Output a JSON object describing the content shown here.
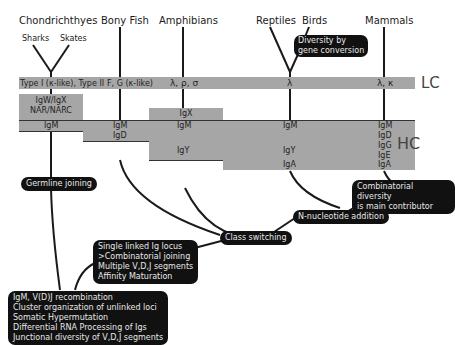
{
  "taxa": {
    "chondrichthyes": "Chondrichthyes",
    "sharks": "Sharks",
    "skates": "Skates",
    "bony_fish": "Bony Fish",
    "amphibians": "Amphibians",
    "reptiles": "Reptiles",
    "birds": "Birds",
    "mammals": "Mammals"
  },
  "light_chain": {
    "label": "LC",
    "chondrichthyes": "Type I (κ-like), Type II",
    "bony_fish": "F, G (κ-like)",
    "amphibians": "λ, ρ, σ",
    "reptiles": "λ",
    "mammals": "λ, κ"
  },
  "heavy_chain": {
    "label": "HC",
    "chondrichthyes_extra": "IgW/IgX\nNAR/NARC",
    "amphibians_extra": "IgX",
    "igm": "IgM",
    "igd": "IgD",
    "igy": "IgY",
    "iga": "IgA",
    "mammals": [
      "IgM",
      "IgD",
      "IgG",
      "IgE",
      "IgA"
    ]
  },
  "annotations": {
    "gene_conversion": "Diversity by\ngene conversion",
    "germline_joining": "Germline joining",
    "combinatorial_diversity": "Combinatorial diversity\nis main contributor",
    "n_nucleotide": "N-nucleotide addition",
    "class_switching": "Class switching",
    "single_linked": "Single linked Ig locus\n>Combinatorial joining\nMultiple V,D,J segments\nAffinity Maturation",
    "root": "IgM, V(D)J recombination\nCluster organization of unlinked loci\nSomatic Hypermutation\nDifferential RNA Processing of Igs\nJunctional diversity of V,D,J segments"
  },
  "colors": {
    "band": "#a6a6a6",
    "box": "#111111",
    "box_text": "#e8e8e8",
    "line": "#1a1a1a"
  }
}
